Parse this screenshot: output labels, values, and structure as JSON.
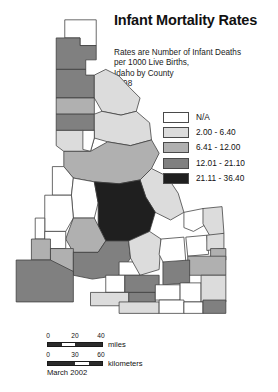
{
  "title": "Infant Mortality Rates",
  "subtitle_lines": [
    "Rates are Number of Infant Deaths",
    "per 1000 Live Births,",
    "Idaho by County",
    "1998"
  ],
  "date_stamp": "March 2002",
  "legend": {
    "entries": [
      {
        "label": "N/A",
        "color": "#ffffff"
      },
      {
        "label": "2.00 - 6.40",
        "color": "#dcdcdc"
      },
      {
        "label": "6.41 - 12.00",
        "color": "#b0b0b0"
      },
      {
        "label": "12.01 - 21.10",
        "color": "#808080"
      },
      {
        "label": "21.11 - 36.40",
        "color": "#1f1f1f"
      }
    ]
  },
  "scale": {
    "miles": {
      "unit_label": "miles",
      "ticks": [
        "0",
        "20",
        "40"
      ]
    },
    "kilometers": {
      "unit_label": "kilometers",
      "ticks": [
        "0",
        "30",
        "60"
      ]
    }
  },
  "chart_data": {
    "type": "choropleth-map",
    "title": "Infant Mortality Rates",
    "subtitle": "Rates are Number of Infant Deaths per 1000 Live Births, Idaho by County 1998",
    "region": "Idaho",
    "unit": "infant deaths per 1000 live births",
    "class_breaks": [
      {
        "label": "N/A",
        "min": null,
        "max": null,
        "color": "#ffffff"
      },
      {
        "label": "2.00 - 6.40",
        "min": 2.0,
        "max": 6.4,
        "color": "#dcdcdc"
      },
      {
        "label": "6.41 - 12.00",
        "min": 6.41,
        "max": 12.0,
        "color": "#b0b0b0"
      },
      {
        "label": "12.01 - 21.10",
        "min": 12.01,
        "max": 21.1,
        "color": "#808080"
      },
      {
        "label": "21.11 - 36.40",
        "min": 21.11,
        "max": 36.4,
        "color": "#1f1f1f"
      }
    ],
    "features": [
      {
        "name": "Boundary",
        "class": "N/A",
        "color": "#ffffff",
        "d": "M61,4 L94,4 L94,31 L77,31 L77,23 L61,23 Z"
      },
      {
        "name": "Bonner",
        "class": "12.01 - 21.10",
        "color": "#808080",
        "d": "M52,23 L61,23 L77,23 L77,31 L94,31 L94,46 L83,46 L83,56 L52,56 Z"
      },
      {
        "name": "Kootenai",
        "class": "12.01 - 21.10",
        "color": "#808080",
        "d": "M52,56 L83,56 L83,62 L92,62 L92,86 L52,86 Z"
      },
      {
        "name": "Shoshone",
        "class": "2.00 - 6.40",
        "color": "#dcdcdc",
        "d": "M92,62 L104,56 L118,63 L129,75 L140,86 L136,100 L120,104 L100,100 L92,86 Z"
      },
      {
        "name": "Benewah",
        "class": "6.41 - 12.00",
        "color": "#b0b0b0",
        "d": "M52,86 L92,86 L92,103 L52,103 Z"
      },
      {
        "name": "Latah",
        "class": "12.01 - 21.10",
        "color": "#808080",
        "d": "M52,103 L92,103 L92,120 L52,120 Z"
      },
      {
        "name": "Clearwater",
        "class": "2.00 - 6.40",
        "color": "#dcdcdc",
        "d": "M92,103 L100,100 L120,104 L136,100 L150,112 L152,130 L130,136 L106,132 L92,128 Z"
      },
      {
        "name": "Nez Perce",
        "class": "2.00 - 6.40",
        "color": "#dcdcdc",
        "d": "M52,120 L80,120 L92,128 L88,142 L60,142 L52,136 Z"
      },
      {
        "name": "Lewis",
        "class": "N/A",
        "color": "#ffffff",
        "d": "M80,120 L92,120 L92,128 L88,142 L80,140 Z"
      },
      {
        "name": "Idaho",
        "class": "6.41 - 12.00",
        "color": "#b0b0b0",
        "d": "M60,142 L88,142 L106,132 L130,136 L152,130 L160,144 L152,160 L140,172 L118,176 L92,174 L70,170 L60,158 Z"
      },
      {
        "name": "Adams",
        "class": "N/A",
        "color": "#ffffff",
        "d": "M48,158 L60,158 L70,170 L68,188 L48,188 Z"
      },
      {
        "name": "Valley",
        "class": "N/A",
        "color": "#ffffff",
        "d": "M68,188 L70,170 L92,174 L96,196 L92,212 L70,212 Z"
      },
      {
        "name": "Lemhi",
        "class": "2.00 - 6.40",
        "color": "#dcdcdc",
        "d": "M140,172 L152,160 L168,168 L180,186 L186,206 L172,214 L156,206 L146,190 Z"
      },
      {
        "name": "Custer",
        "class": "21.11 - 36.40",
        "color": "#1f1f1f",
        "d": "M92,174 L118,176 L140,172 L146,190 L156,206 L150,226 L128,236 L104,236 L96,220 L96,196 Z"
      },
      {
        "name": "Washington",
        "class": "N/A",
        "color": "#ffffff",
        "d": "M40,188 L68,188 L70,212 L62,226 L40,226 Z"
      },
      {
        "name": "Boise",
        "class": "6.41 - 12.00",
        "color": "#b0b0b0",
        "d": "M70,212 L92,212 L96,220 L104,236 L96,248 L70,248 L62,234 Z"
      },
      {
        "name": "Payette",
        "class": "N/A",
        "color": "#ffffff",
        "d": "M30,212 L40,212 L40,234 L30,234 Z"
      },
      {
        "name": "Gem",
        "class": "N/A",
        "color": "#ffffff",
        "d": "M40,226 L62,226 L62,244 L40,244 Z"
      },
      {
        "name": "Canyon",
        "class": "6.41 - 12.00",
        "color": "#b0b0b0",
        "d": "M26,234 L46,234 L46,256 L26,256 Z"
      },
      {
        "name": "Ada",
        "class": "6.41 - 12.00",
        "color": "#b0b0b0",
        "d": "M46,244 L70,244 L70,268 L46,268 Z"
      },
      {
        "name": "Elmore",
        "class": "12.01 - 21.10",
        "color": "#808080",
        "d": "M70,248 L96,248 L104,236 L128,236 L130,254 L118,272 L90,276 L70,272 Z"
      },
      {
        "name": "Owyhee",
        "class": "12.01 - 21.10",
        "color": "#808080",
        "d": "M10,256 L46,256 L70,268 L70,300 L10,300 Z"
      },
      {
        "name": "Camas",
        "class": "N/A",
        "color": "#ffffff",
        "d": "M118,258 L140,258 L140,272 L118,272 Z"
      },
      {
        "name": "Blaine",
        "class": "2.00 - 6.40",
        "color": "#dcdcdc",
        "d": "M128,236 L150,226 L162,234 L160,266 L140,272 L130,254 Z"
      },
      {
        "name": "Gooding",
        "class": "N/A",
        "color": "#ffffff",
        "d": "M104,272 L124,272 L124,290 L104,290 Z"
      },
      {
        "name": "Lincoln",
        "class": "12.01 - 21.10",
        "color": "#808080",
        "d": "M124,272 L160,272 L160,290 L124,290 Z"
      },
      {
        "name": "Jerome",
        "class": "N/A",
        "color": "#ffffff",
        "d": "M104,290 L128,290 L128,302 L104,302 Z"
      },
      {
        "name": "Minidoka",
        "class": "12.01 - 21.10",
        "color": "#808080",
        "d": "M128,290 L156,290 L156,304 L128,304 Z"
      },
      {
        "name": "Twin Falls",
        "class": "2.00 - 6.40",
        "color": "#dcdcdc",
        "d": "M88,290 L128,290 L128,304 L88,304 Z"
      },
      {
        "name": "Cassia",
        "class": "2.00 - 6.40",
        "color": "#dcdcdc",
        "d": "M118,300 L160,300 L160,312 L118,312 Z"
      },
      {
        "name": "Butte",
        "class": "N/A",
        "color": "#ffffff",
        "d": "M162,234 L186,232 L188,258 L166,262 L160,250 Z"
      },
      {
        "name": "Clark",
        "class": "N/A",
        "color": "#ffffff",
        "d": "M186,206 L206,202 L214,216 L196,226 L186,222 Z"
      },
      {
        "name": "Fremont",
        "class": "2.00 - 6.40",
        "color": "#dcdcdc",
        "d": "M206,202 L226,200 L228,228 L214,232 L206,218 Z"
      },
      {
        "name": "Jefferson",
        "class": "N/A",
        "color": "#ffffff",
        "d": "M188,232 L210,230 L212,250 L190,252 Z"
      },
      {
        "name": "Madison",
        "class": "2.00 - 6.40",
        "color": "#dcdcdc",
        "d": "M210,230 L228,228 L228,244 L210,246 Z"
      },
      {
        "name": "Teton",
        "class": "6.41 - 12.00",
        "color": "#b0b0b0",
        "d": "M214,244 L230,244 L230,256 L214,256 Z"
      },
      {
        "name": "Bonneville",
        "class": "6.41 - 12.00",
        "color": "#b0b0b0",
        "d": "M190,252 L230,252 L230,272 L190,272 Z"
      },
      {
        "name": "Bingham",
        "class": "12.01 - 21.10",
        "color": "#808080",
        "d": "M164,258 L192,256 L192,280 L164,282 Z"
      },
      {
        "name": "Power",
        "class": "N/A",
        "color": "#ffffff",
        "d": "M156,282 L182,282 L182,298 L156,298 Z"
      },
      {
        "name": "Bannock",
        "class": "N/A",
        "color": "#ffffff",
        "d": "M182,280 L204,280 L204,300 L182,300 Z"
      },
      {
        "name": "Caribou",
        "class": "2.00 - 6.40",
        "color": "#dcdcdc",
        "d": "M204,272 L230,272 L230,300 L204,300 Z"
      },
      {
        "name": "Oneida",
        "class": "N/A",
        "color": "#ffffff",
        "d": "M160,298 L186,298 L186,312 L160,312 Z"
      },
      {
        "name": "Franklin",
        "class": "N/A",
        "color": "#ffffff",
        "d": "M186,300 L206,300 L206,312 L186,312 Z"
      },
      {
        "name": "Bear Lake",
        "class": "12.01 - 21.10",
        "color": "#808080",
        "d": "M206,298 L230,298 L230,312 L206,312 Z"
      }
    ]
  }
}
